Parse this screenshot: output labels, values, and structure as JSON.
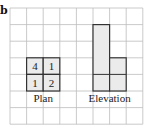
{
  "figure": {
    "part_label": "b",
    "grid": {
      "cols": 8,
      "rows": 7,
      "origin_x": 10,
      "origin_y": 8,
      "cell": 16.6
    },
    "plan": {
      "label": "Plan",
      "cells": [
        {
          "col": 1,
          "row": 3,
          "value": "4"
        },
        {
          "col": 2,
          "row": 3,
          "value": "1"
        },
        {
          "col": 1,
          "row": 4,
          "value": "1"
        },
        {
          "col": 2,
          "row": 4,
          "value": "2"
        }
      ]
    },
    "elevation": {
      "label": "Elevation",
      "columns": [
        {
          "col": 5,
          "height": 4
        },
        {
          "col": 6,
          "height": 2
        }
      ],
      "base_row": 4
    },
    "colors": {
      "grid": "#bdbdbd",
      "outline": "#333333",
      "fill": "#ebebeb"
    }
  }
}
